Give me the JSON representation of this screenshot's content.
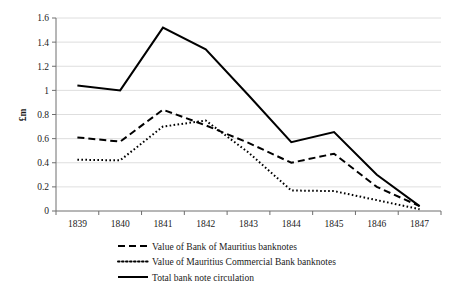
{
  "chart_data": {
    "type": "line",
    "title": "",
    "xlabel": "",
    "ylabel": "£m",
    "ylim": [
      0,
      1.6
    ],
    "ytick_labels": [
      "0",
      "0.2",
      "0.4",
      "0.6",
      "0.8",
      "1",
      "1.2",
      "1.4",
      "1.6"
    ],
    "ytick_values": [
      0,
      0.2,
      0.4,
      0.6,
      0.8,
      1.0,
      1.2,
      1.4,
      1.6
    ],
    "grid": true,
    "legend_position": "bottom",
    "categories": [
      "1839",
      "1840",
      "1841",
      "1842",
      "1843",
      "1844",
      "1845",
      "1846",
      "1847"
    ],
    "series": [
      {
        "name": "Value of Bank of Mauritius banknotes",
        "style": "dashed",
        "color": "#000000",
        "values": [
          0.61,
          0.575,
          0.84,
          0.71,
          0.565,
          0.4,
          0.475,
          0.2,
          0.04
        ]
      },
      {
        "name": "Value of Mauritius Commercial Bank banknotes",
        "style": "dotted",
        "color": "#000000",
        "values": [
          0.425,
          0.42,
          0.7,
          0.75,
          0.485,
          0.17,
          0.165,
          0.09,
          0.015
        ]
      },
      {
        "name": "Total bank note circulation",
        "style": "solid",
        "color": "#000000",
        "values": [
          1.04,
          1.0,
          1.52,
          1.34,
          0.96,
          0.57,
          0.655,
          0.3,
          0.04
        ]
      }
    ]
  }
}
